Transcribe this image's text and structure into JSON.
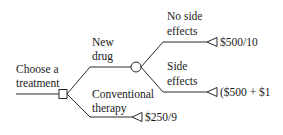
{
  "diagram": {
    "type": "decision-tree",
    "root_label_line1": "Choose a",
    "root_label_line2": "treatment",
    "decision_node": "decision-square",
    "branches": {
      "new_drug": {
        "label_line1": "New",
        "label_line2": "drug",
        "node": "chance-circle",
        "outcomes": {
          "no_side_effects": {
            "label_line1": "No side",
            "label_line2": "effects",
            "payoff": "$500/10",
            "terminal": "triangle-terminal"
          },
          "side_effects": {
            "label_line1": "Side",
            "label_line2": "effects",
            "payoff": "($500 + $1",
            "terminal": "triangle-terminal"
          }
        }
      },
      "conventional": {
        "label_line1": "Conventional",
        "label_line2": "therapy",
        "payoff": "$250/9",
        "terminal": "triangle-terminal"
      }
    },
    "colors": {
      "line": "#2a2a2a",
      "text": "#1a1a1a",
      "background": "#ffffff"
    }
  }
}
